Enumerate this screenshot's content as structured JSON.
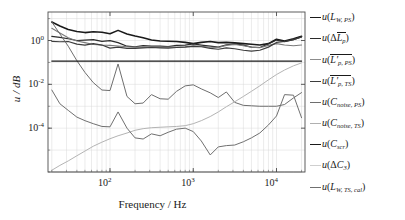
{
  "chart_data": {
    "type": "line",
    "title": "",
    "xlabel": "Frequency / Hz",
    "ylabel": "u / dB",
    "xscale": "log",
    "yscale": "log",
    "xlim": [
      18,
      22000
    ],
    "ylim": [
      1e-06,
      20
    ],
    "xticks": [
      100,
      1000,
      10000
    ],
    "xticklabels": [
      "10^2",
      "10^3",
      "10^4"
    ],
    "yticks": [
      1,
      0.01,
      0.0001
    ],
    "yticklabels": [
      "10^0",
      "10^-2",
      "10^-4"
    ],
    "grid": true,
    "legend_position": "right-outside",
    "x": [
      20,
      25,
      31.5,
      40,
      50,
      63,
      80,
      100,
      125,
      160,
      200,
      250,
      315,
      400,
      500,
      630,
      800,
      1000,
      1250,
      1600,
      2000,
      2500,
      3150,
      4000,
      5000,
      6300,
      8000,
      10000,
      12500,
      16000,
      20000
    ],
    "series": [
      {
        "name": "u(L_W, PS)",
        "label_main": "L",
        "color": "#1a1a1a",
        "width": 1.6,
        "values": [
          7.0,
          4.6,
          3.2,
          2.6,
          2.3,
          2.5,
          2.4,
          2.05,
          2.9,
          2.0,
          1.6,
          1.35,
          1.05,
          0.95,
          0.93,
          0.9,
          0.82,
          0.72,
          0.82,
          0.9,
          0.8,
          0.82,
          0.78,
          0.72,
          0.68,
          0.62,
          0.72,
          1.15,
          0.95,
          1.2,
          1.55
        ]
      },
      {
        "name": "u(ΔL̄_p)",
        "color": "#2b2b2b",
        "width": 1.2,
        "values": [
          1.55,
          1.4,
          1.2,
          1.0,
          1.05,
          1.1,
          0.92,
          0.98,
          0.8,
          0.55,
          0.52,
          0.58,
          0.55,
          0.55,
          0.53,
          0.6,
          0.62,
          0.7,
          0.62,
          0.55,
          0.5,
          0.64,
          0.7,
          0.62,
          0.5,
          0.48,
          0.7,
          1.05,
          0.88,
          1.1,
          1.45
        ]
      },
      {
        "name": "u(L̄'_p, PS)",
        "color": "#7a7a7a",
        "width": 1.1,
        "values": [
          3.6,
          2.2,
          1.35,
          0.95,
          0.8,
          0.66,
          0.62,
          0.6,
          0.56,
          0.52,
          0.5,
          0.5,
          0.5,
          0.5,
          0.5,
          0.5,
          0.52,
          0.58,
          0.55,
          0.5,
          0.48,
          0.6,
          0.66,
          0.58,
          0.5,
          0.47,
          0.6,
          0.72,
          0.62,
          0.58,
          0.62
        ]
      },
      {
        "name": "u(L̄'_p, TS)",
        "color": "#3d3d3d",
        "width": 1.2,
        "values": [
          0.92,
          0.88,
          0.9,
          0.68,
          0.62,
          0.72,
          0.62,
          0.45,
          0.5,
          0.44,
          0.44,
          0.46,
          0.48,
          0.46,
          0.45,
          0.48,
          0.5,
          0.54,
          0.52,
          0.44,
          0.4,
          0.46,
          0.42,
          0.36,
          0.33,
          0.36,
          0.5,
          0.82,
          0.9,
          1.1,
          1.45
        ]
      },
      {
        "name": "u(C_noise, PS)",
        "color": "#6e6e6e",
        "width": 1.0,
        "values": [
          7.0,
          2.0,
          0.55,
          0.12,
          0.035,
          0.012,
          0.0055,
          0.0052,
          0.085,
          0.0028,
          0.0013,
          0.0014,
          0.0034,
          0.0022,
          0.0021,
          0.0048,
          0.0085,
          0.0095,
          0.0062,
          0.0041,
          0.0025,
          0.0045,
          0.0015,
          0.0011,
          0.00105,
          0.001,
          0.001,
          0.001,
          0.0012,
          0.0024,
          0.0042
        ]
      },
      {
        "name": "u(C_noise, TS)",
        "color": "#b4b4b4",
        "width": 1.0,
        "values": [
          1.2e-06,
          2e-06,
          3.2e-06,
          5.5e-06,
          9e-06,
          1.5e-05,
          2.3e-05,
          3.3e-05,
          4.5e-05,
          6e-05,
          8e-05,
          9.5e-05,
          0.000105,
          0.00011,
          0.000115,
          0.00012,
          0.00013,
          0.00016,
          0.00022,
          0.00034,
          0.00055,
          0.00095,
          0.0016,
          0.0028,
          0.0048,
          0.0085,
          0.016,
          0.028,
          0.045,
          0.07,
          0.095
        ]
      },
      {
        "name": "u(C_scr)",
        "color": "#1a1a1a",
        "width": 1.3,
        "values": [
          0.115,
          0.115,
          0.115,
          0.115,
          0.115,
          0.115,
          0.115,
          0.115,
          0.115,
          0.115,
          0.115,
          0.115,
          0.115,
          0.115,
          0.115,
          0.115,
          0.115,
          0.115,
          0.115,
          0.115,
          0.115,
          0.115,
          0.115,
          0.115,
          0.115,
          0.115,
          0.115,
          0.115,
          0.115,
          0.115,
          0.115
        ]
      },
      {
        "name": "u(ΔC_3)",
        "color": "#c8c8c8",
        "width": 1.0,
        "values": [
          1e-06,
          1e-06,
          1e-06,
          1e-06,
          1e-06,
          1e-06,
          1e-06,
          1e-06,
          1e-06,
          1e-06,
          1e-06,
          1e-06,
          1e-06,
          1e-06,
          1e-06,
          1e-06,
          1e-06,
          1e-06,
          1e-06,
          1e-06,
          1e-06,
          1e-06,
          1e-06,
          1e-06,
          1e-06,
          1e-06,
          1e-06,
          1e-06,
          1e-06,
          1e-06,
          1e-06
        ]
      },
      {
        "name": "u(L_W, TS, cal)",
        "color": "#707070",
        "width": 1.0,
        "values": [
          0.0055,
          0.0013,
          0.00065,
          0.00032,
          0.00022,
          0.00016,
          0.00012,
          0.000115,
          0.00055,
          0.0001,
          3.6e-05,
          3.2e-05,
          5.5e-05,
          4.5e-05,
          6.5e-05,
          9e-05,
          0.0001,
          7e-05,
          2.6e-05,
          6e-06,
          1.4e-05,
          1.6e-05,
          1.7e-05,
          2.4e-05,
          3.6e-05,
          6e-05,
          0.00014,
          0.00036,
          0.0034,
          0.0032,
          0.0003
        ]
      }
    ]
  },
  "axes": {
    "ylabel_u": "u",
    "ylabel_sep": " / ",
    "ylabel_unit": "dB",
    "xlabel": "Frequency / Hz",
    "xtick_labels": [
      {
        "mantissa": "10",
        "exp": "2"
      },
      {
        "mantissa": "10",
        "exp": "3"
      },
      {
        "mantissa": "10",
        "exp": "4"
      }
    ],
    "ytick_labels": [
      {
        "mantissa": "10",
        "exp": "0"
      },
      {
        "mantissa": "10",
        "exp": "-2"
      },
      {
        "mantissa": "10",
        "exp": "-4"
      }
    ]
  },
  "legend": {
    "items": [
      {
        "u": "u",
        "open": "(",
        "main": "L",
        "sub": "W, PS",
        "close": ")",
        "color": "#1a1a1a",
        "width": 1.8,
        "overline": false,
        "prime": false,
        "delta": ""
      },
      {
        "u": "u",
        "open": "(",
        "main": "L",
        "sub": "p",
        "close": ")",
        "color": "#2b2b2b",
        "width": 1.4,
        "overline": true,
        "prime": false,
        "delta": "Δ"
      },
      {
        "u": "u",
        "open": "(",
        "main": "L",
        "sub": "p, PS",
        "close": ")",
        "color": "#8c8c8c",
        "width": 1.3,
        "overline": true,
        "prime": true,
        "delta": ""
      },
      {
        "u": "u",
        "open": "(",
        "main": "L",
        "sub": "p, TS",
        "close": ")",
        "color": "#3d3d3d",
        "width": 1.4,
        "overline": true,
        "prime": true,
        "delta": ""
      },
      {
        "u": "u",
        "open": "(",
        "main": "C",
        "sub": "noise, PS",
        "close": ")",
        "color": "#6e6e6e",
        "width": 1.2,
        "overline": false,
        "prime": false,
        "delta": ""
      },
      {
        "u": "u",
        "open": "(",
        "main": "C",
        "sub": "noise, TS",
        "close": ")",
        "color": "#b0b0b0",
        "width": 1.2,
        "overline": false,
        "prime": false,
        "delta": ""
      },
      {
        "u": "u",
        "open": "(",
        "main": "C",
        "sub": "scr",
        "close": ")",
        "color": "#1a1a1a",
        "width": 1.6,
        "overline": false,
        "prime": false,
        "delta": ""
      },
      {
        "u": "u",
        "open": "(",
        "main": "C",
        "sub": "3",
        "close": ")",
        "color": "#cfcfcf",
        "width": 1.2,
        "overline": false,
        "prime": false,
        "delta": "Δ"
      },
      {
        "u": "u",
        "open": "(",
        "main": "L",
        "sub": "W, TS, cal",
        "close": ")",
        "color": "#707070",
        "width": 1.2,
        "overline": false,
        "prime": false,
        "delta": ""
      }
    ]
  },
  "style": {
    "axis_color": "#4d4d4d",
    "grid_color": "#d9d9d9",
    "background": "#ffffff"
  }
}
